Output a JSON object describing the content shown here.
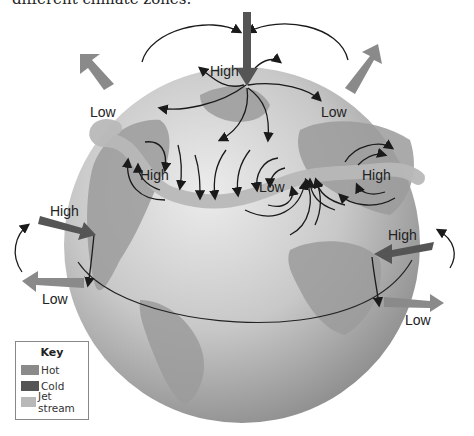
{
  "caption": "different climate zones.",
  "labels": {
    "top_high": "High",
    "top_left_low": "Low",
    "top_right_low": "Low",
    "mid_left_high": "High",
    "mid_low": "Low",
    "mid_right_high": "High",
    "left_high": "High",
    "left_low": "Low",
    "right_high": "High",
    "right_low": "Low"
  },
  "key": {
    "title": "Key",
    "items": [
      {
        "label": "Hot",
        "color": "#8a8a8a"
      },
      {
        "label": "Cold",
        "color": "#555555"
      },
      {
        "label": "Jet stream",
        "color": "#b8b8b8"
      }
    ]
  },
  "colors": {
    "globe_light": "#d9d9d9",
    "globe_dark": "#8f8f8f",
    "land": "#9a9a9a",
    "hot_arrow": "#8a8a8a",
    "cold_arrow": "#555555",
    "jet_stream": "#b8b8b8",
    "flow_arrow": "#1a1a1a"
  }
}
